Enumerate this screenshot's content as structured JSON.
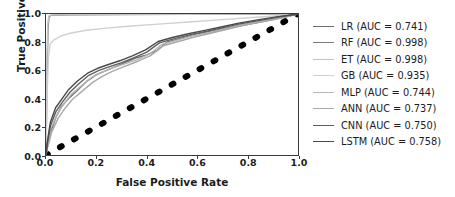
{
  "chart_data": {
    "type": "line",
    "title": "",
    "xlabel": "False Positive Rate",
    "ylabel": "True Positive Rate",
    "xlim": [
      0.0,
      1.0
    ],
    "ylim": [
      0.0,
      1.0
    ],
    "xticks": [
      "0.0",
      "0.2",
      "0.4",
      "0.6",
      "0.8",
      "1.0"
    ],
    "yticks": [
      "0.0",
      "0.2",
      "0.4",
      "0.6",
      "0.8",
      "1.0"
    ],
    "grid": false,
    "legend_position": "right",
    "reference_line": {
      "name": "chance-diagonal",
      "style": "dotted",
      "color": "#000000",
      "x": [
        0.0,
        1.0
      ],
      "y": [
        0.0,
        1.0
      ]
    },
    "series": [
      {
        "name": "LR",
        "metric_label": "AUC",
        "auc": 0.741,
        "legend": "LR (AUC = 0.741)",
        "color": "#6e6e6e",
        "x": [
          0.0,
          0.005,
          0.02,
          0.04,
          0.06,
          0.09,
          0.12,
          0.16,
          0.2,
          0.24,
          0.28,
          0.32,
          0.36,
          0.4,
          0.44,
          0.48,
          0.52,
          0.56,
          0.6,
          0.66,
          0.72,
          0.78,
          0.84,
          0.9,
          0.95,
          1.0
        ],
        "y": [
          0.0,
          0.06,
          0.17,
          0.27,
          0.34,
          0.4,
          0.45,
          0.52,
          0.57,
          0.6,
          0.63,
          0.66,
          0.69,
          0.71,
          0.74,
          0.8,
          0.82,
          0.84,
          0.86,
          0.88,
          0.9,
          0.92,
          0.94,
          0.96,
          0.98,
          1.0
        ]
      },
      {
        "name": "RF",
        "metric_label": "AUC",
        "auc": 0.998,
        "legend": "RF (AUC = 0.998)",
        "color": "#7a7a7a",
        "x": [
          0.0,
          0.004,
          0.008,
          0.012,
          0.02,
          0.05,
          0.12,
          0.3,
          0.55,
          0.8,
          1.0
        ],
        "y": [
          0.0,
          0.55,
          0.9,
          0.982,
          0.99,
          0.993,
          0.995,
          0.996,
          0.997,
          0.998,
          1.0
        ]
      },
      {
        "name": "ET",
        "metric_label": "AUC",
        "auc": 0.998,
        "legend": "ET (AUC = 0.998)",
        "color": "#c4c4c4",
        "x": [
          0.0,
          0.003,
          0.007,
          0.011,
          0.02,
          0.05,
          0.12,
          0.3,
          0.55,
          0.8,
          1.0
        ],
        "y": [
          0.0,
          0.6,
          0.92,
          0.986,
          0.992,
          0.994,
          0.996,
          0.997,
          0.998,
          0.999,
          1.0
        ]
      },
      {
        "name": "GB",
        "metric_label": "AUC",
        "auc": 0.935,
        "legend": "GB (AUC = 0.935)",
        "color": "#d0d0d0",
        "x": [
          0.0,
          0.004,
          0.01,
          0.016,
          0.03,
          0.06,
          0.1,
          0.16,
          0.24,
          0.34,
          0.46,
          0.58,
          0.7,
          0.82,
          0.92,
          1.0
        ],
        "y": [
          0.0,
          0.42,
          0.7,
          0.785,
          0.815,
          0.845,
          0.865,
          0.885,
          0.9,
          0.915,
          0.93,
          0.945,
          0.96,
          0.975,
          0.988,
          1.0
        ]
      },
      {
        "name": "MLP",
        "metric_label": "AUC",
        "auc": 0.744,
        "legend": "MLP (AUC = 0.744)",
        "color": "#b5b5b5",
        "x": [
          0.0,
          0.006,
          0.02,
          0.045,
          0.07,
          0.1,
          0.14,
          0.18,
          0.22,
          0.26,
          0.31,
          0.36,
          0.41,
          0.46,
          0.52,
          0.58,
          0.64,
          0.71,
          0.78,
          0.86,
          0.93,
          1.0
        ],
        "y": [
          0.0,
          0.07,
          0.19,
          0.29,
          0.36,
          0.43,
          0.49,
          0.55,
          0.585,
          0.615,
          0.645,
          0.675,
          0.715,
          0.785,
          0.815,
          0.845,
          0.865,
          0.895,
          0.925,
          0.95,
          0.975,
          1.0
        ]
      },
      {
        "name": "ANN",
        "metric_label": "AUC",
        "auc": 0.737,
        "legend": "ANN (AUC = 0.737)",
        "color": "#a8a8a8",
        "x": [
          0.0,
          0.006,
          0.022,
          0.048,
          0.075,
          0.105,
          0.145,
          0.185,
          0.225,
          0.265,
          0.315,
          0.365,
          0.415,
          0.465,
          0.525,
          0.585,
          0.645,
          0.715,
          0.785,
          0.865,
          0.935,
          1.0
        ],
        "y": [
          0.0,
          0.05,
          0.16,
          0.26,
          0.33,
          0.395,
          0.455,
          0.515,
          0.56,
          0.595,
          0.63,
          0.665,
          0.705,
          0.775,
          0.805,
          0.835,
          0.86,
          0.89,
          0.92,
          0.948,
          0.972,
          1.0
        ]
      },
      {
        "name": "CNN",
        "metric_label": "AUC",
        "auc": 0.75,
        "legend": "CNN (AUC = 0.750)",
        "color": "#5f5f5f",
        "x": [
          0.0,
          0.005,
          0.018,
          0.04,
          0.065,
          0.095,
          0.13,
          0.17,
          0.21,
          0.25,
          0.3,
          0.35,
          0.4,
          0.45,
          0.51,
          0.57,
          0.63,
          0.7,
          0.77,
          0.85,
          0.92,
          1.0
        ],
        "y": [
          0.0,
          0.08,
          0.21,
          0.31,
          0.375,
          0.445,
          0.505,
          0.565,
          0.6,
          0.625,
          0.655,
          0.69,
          0.73,
          0.795,
          0.825,
          0.852,
          0.875,
          0.902,
          0.93,
          0.955,
          0.978,
          1.0
        ]
      },
      {
        "name": "LSTM",
        "metric_label": "AUC",
        "auc": 0.758,
        "legend": "LSTM (AUC = 0.758)",
        "color": "#4a4a4a",
        "x": [
          0.0,
          0.005,
          0.017,
          0.038,
          0.062,
          0.09,
          0.125,
          0.165,
          0.205,
          0.245,
          0.295,
          0.345,
          0.395,
          0.445,
          0.505,
          0.565,
          0.625,
          0.695,
          0.765,
          0.845,
          0.915,
          1.0
        ],
        "y": [
          0.0,
          0.09,
          0.23,
          0.335,
          0.395,
          0.465,
          0.525,
          0.58,
          0.615,
          0.64,
          0.67,
          0.705,
          0.745,
          0.805,
          0.835,
          0.86,
          0.882,
          0.908,
          0.935,
          0.96,
          0.98,
          1.0
        ]
      }
    ]
  }
}
